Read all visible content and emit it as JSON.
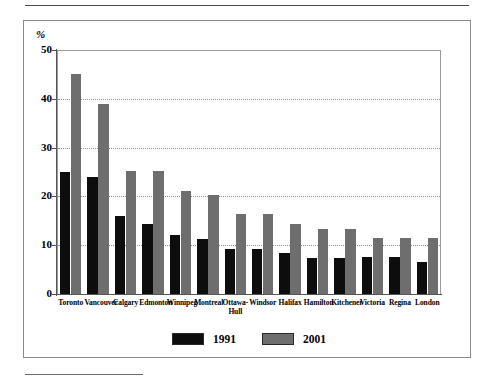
{
  "figure": {
    "y_unit_label": "%",
    "legend_position": "bottom-center"
  },
  "chart_data": {
    "type": "bar",
    "title": "",
    "subtitle": "",
    "xlabel": "",
    "ylabel": "%",
    "ylim": [
      0,
      50
    ],
    "yticks": [
      0,
      10,
      20,
      30,
      40,
      50
    ],
    "ytick_labels": [
      "0",
      "10",
      "20",
      "30",
      "40",
      "50"
    ],
    "grid": true,
    "grid_axis": "y",
    "legend": [
      "1991",
      "2001"
    ],
    "legend_position": "bottom-center",
    "categories": [
      "Toronto",
      "Vancouver",
      "Calgary",
      "Edmonton",
      "Winnipeg",
      "Montreal",
      "Ottawa-\nHull",
      "Windsor",
      "Halifax",
      "Hamilton",
      "Kitchener",
      "Victoria",
      "Regina",
      "London"
    ],
    "series": [
      {
        "name": "1991",
        "color": "#0d0d0d",
        "values": [
          25.0,
          24.0,
          16.0,
          14.3,
          12.0,
          11.3,
          9.3,
          9.3,
          8.4,
          7.4,
          7.4,
          7.5,
          7.5,
          6.5
        ]
      },
      {
        "name": "2001",
        "color": "#6e6e6e",
        "values": [
          45.0,
          39.0,
          25.2,
          25.2,
          21.2,
          20.3,
          16.3,
          16.3,
          14.4,
          13.3,
          13.3,
          11.5,
          11.5,
          11.5
        ]
      }
    ]
  }
}
